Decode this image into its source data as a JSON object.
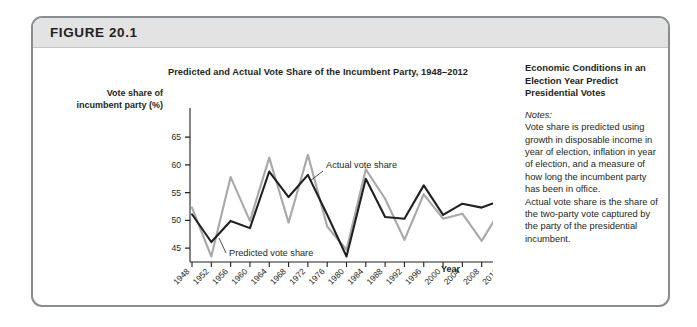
{
  "figure": {
    "number_label": "FIGURE 20.1"
  },
  "notes": {
    "heading": "Economic Conditions in an Election Year Predict Presidential Votes",
    "label": "Notes:",
    "paragraph_1": "Vote share is predicted using growth in disposable income in year of election, inflation in year of election, and a measure of how long the incumbent party has been in office.",
    "paragraph_2": "Actual vote share is the share of the two-party vote captured by the party of the presidential incumbent."
  },
  "chart_data": {
    "type": "line",
    "title": "Predicted and Actual Vote Share of the Incumbent Party, 1948–2012",
    "xlabel": "Year",
    "ylabel": "Vote share of incumbent party (%)",
    "ylabel_line_1": "Vote share of",
    "ylabel_line_2": "incumbent party (%)",
    "ylim": [
      42.5,
      67
    ],
    "yticks": [
      65,
      60,
      55,
      50,
      45
    ],
    "ytick_labels": [
      "65",
      "60",
      "55",
      "50",
      "45"
    ],
    "grid": false,
    "legend_position": "inline-annotation",
    "categories": [
      1948,
      1952,
      1956,
      1960,
      1964,
      1968,
      1972,
      1976,
      1980,
      1984,
      1988,
      1992,
      1996,
      2000,
      2004,
      2008,
      2012
    ],
    "xtick_labels": [
      "1948",
      "1952",
      "1956",
      "1960",
      "1964",
      "1968",
      "1972",
      "1976",
      "1980",
      "1984",
      "1988",
      "1992",
      "1996",
      "2000",
      "2004",
      "2008",
      "2012"
    ],
    "series": [
      {
        "name": "Actual vote share",
        "color": "#a8a8a8",
        "annotation": "Actual vote share",
        "values": [
          52.3,
          43.5,
          57.8,
          49.9,
          61.3,
          49.6,
          61.8,
          48.9,
          44.7,
          59.2,
          53.9,
          46.5,
          54.7,
          50.3,
          51.2,
          46.3,
          52.0
        ]
      },
      {
        "name": "Predicted vote share",
        "color": "#231f20",
        "annotation": "Predicted vote share",
        "values": [
          51.1,
          46.1,
          49.9,
          48.6,
          58.8,
          54.2,
          58.2,
          51.0,
          43.5,
          57.5,
          50.6,
          50.3,
          56.3,
          51.0,
          53.0,
          52.3,
          53.6
        ]
      }
    ]
  }
}
